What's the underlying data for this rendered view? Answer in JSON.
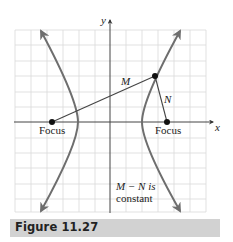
{
  "figure": {
    "caption": "Figure 11.27",
    "axis_labels": {
      "x": "x",
      "y": "y"
    },
    "focus_left_label": "Focus",
    "focus_right_label": "Focus",
    "segment_m_label": "M",
    "segment_n_label": "N",
    "note_line1": "M − N is",
    "note_line2": "constant",
    "colors": {
      "curve": "#6e6e6e",
      "grid": "#d9d9d9",
      "axis": "#555555",
      "segment": "#444444",
      "point": "#111111",
      "caption_bg": "#d2d2d2"
    }
  },
  "diagram": {
    "type": "hyperbola",
    "grid": {
      "cols": 12,
      "rows": 11
    },
    "elements": [
      {
        "name": "left-branch",
        "kind": "curve",
        "arrows": "both-ends"
      },
      {
        "name": "right-branch",
        "kind": "curve",
        "arrows": "both-ends"
      },
      {
        "name": "left-focus",
        "kind": "point",
        "label": "Focus"
      },
      {
        "name": "right-focus",
        "kind": "point",
        "label": "Focus"
      },
      {
        "name": "point-on-curve",
        "kind": "point"
      },
      {
        "name": "segment-M",
        "kind": "segment",
        "from": "left-focus",
        "to": "point-on-curve",
        "label": "M"
      },
      {
        "name": "segment-N",
        "kind": "segment",
        "from": "right-focus",
        "to": "point-on-curve",
        "label": "N"
      }
    ],
    "annotation": "M − N is constant"
  }
}
